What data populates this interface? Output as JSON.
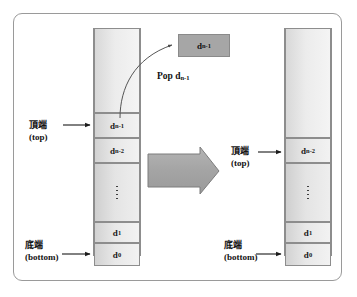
{
  "figure": {
    "title_semantics": "stack-pop-operation-diagram",
    "colors": {
      "frame_border": "#9a9a9a",
      "cell_border": "#8d8d8d",
      "cell_fill_light": "#f2f2f2",
      "cell_fill_dark": "#d2d2d2",
      "popped_box_fill": "#a6a6a6",
      "big_arrow_fill": "#a8a8a8",
      "text": "#111111"
    }
  },
  "left_stack": {
    "name": "before-pop-stack",
    "cells": [
      {
        "id": "empty-top",
        "label": "",
        "type": "empty"
      },
      {
        "id": "d-n-1",
        "label": "d",
        "sub": "n-1",
        "type": "value"
      },
      {
        "id": "d-n-2",
        "label": "d",
        "sub": "n-2",
        "type": "value"
      },
      {
        "id": "ellipsis",
        "label": "⋮",
        "type": "dots"
      },
      {
        "id": "d-1",
        "label": "d",
        "sub": "1",
        "type": "value"
      },
      {
        "id": "d-0",
        "label": "d",
        "sub": "0",
        "type": "value"
      }
    ],
    "top_label": {
      "cn": "頂端",
      "en": "(top)"
    },
    "bottom_label": {
      "cn": "底端",
      "en": "(bottom)"
    }
  },
  "right_stack": {
    "name": "after-pop-stack",
    "cells": [
      {
        "id": "empty-top",
        "label": "",
        "type": "empty"
      },
      {
        "id": "d-n-2",
        "label": "d",
        "sub": "n-2",
        "type": "value"
      },
      {
        "id": "ellipsis",
        "label": "⋮",
        "type": "dots"
      },
      {
        "id": "d-1",
        "label": "d",
        "sub": "1",
        "type": "value"
      },
      {
        "id": "d-0",
        "label": "d",
        "sub": "0",
        "type": "value"
      }
    ],
    "top_label": {
      "cn": "頂端",
      "en": "(top)"
    },
    "bottom_label": {
      "cn": "底端",
      "en": "(bottom)"
    }
  },
  "popped_element": {
    "name": "popped-value-box",
    "label": "d",
    "sub": "n-1"
  },
  "pop_annotation": {
    "name": "pop-curve-label",
    "text": "Pop d",
    "sub": "n-1"
  },
  "transition_arrow": {
    "name": "pop-transition-arrow",
    "text": "疊出d",
    "sub": "n-1"
  }
}
